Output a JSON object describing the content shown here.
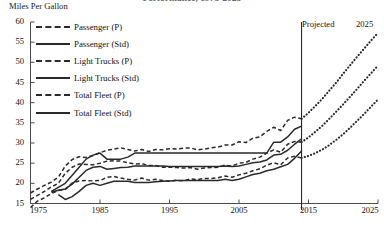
{
  "chart_data": {
    "type": "line",
    "title": "Performance, 1975-2025",
    "ylabel": "Miles Per Gallon",
    "xlabel": "",
    "xlim": [
      1975,
      2025
    ],
    "ylim": [
      15,
      60
    ],
    "y_ticks": [
      60,
      55,
      50,
      45,
      40,
      35,
      30,
      25,
      20,
      15
    ],
    "x_ticks": [
      1975,
      1985,
      1995,
      2005,
      2015,
      2025
    ],
    "grid": false,
    "legend_position": "upper-left",
    "projection_divider_year": 2014,
    "annotations": [
      {
        "text": "Projected",
        "x": 2015,
        "y": 58
      },
      {
        "text": "2025",
        "x": 2025,
        "y": 59
      }
    ],
    "series": [
      {
        "name": "Passenger (P)",
        "style": "dashed",
        "segment": "historical",
        "x": [
          1975,
          1976,
          1977,
          1978,
          1979,
          1980,
          1981,
          1982,
          1983,
          1984,
          1985,
          1986,
          1987,
          1988,
          1989,
          1990,
          1991,
          1992,
          1993,
          1994,
          1995,
          1996,
          1997,
          1998,
          1999,
          2000,
          2001,
          2002,
          2003,
          2004,
          2005,
          2006,
          2007,
          2008,
          2009,
          2010,
          2011,
          2012,
          2013,
          2014
        ],
        "values": [
          17.6,
          18.6,
          19.5,
          20.3,
          21.5,
          24.3,
          25.9,
          26.6,
          26.4,
          26.9,
          27.6,
          28.2,
          28.5,
          28.8,
          28.4,
          28.0,
          28.4,
          27.9,
          28.4,
          28.3,
          28.6,
          28.5,
          28.7,
          28.8,
          28.3,
          28.5,
          28.8,
          29.0,
          29.5,
          29.5,
          30.3,
          30.1,
          31.2,
          31.5,
          32.9,
          33.9,
          33.1,
          35.6,
          36.4,
          36.0
        ]
      },
      {
        "name": "Passenger (Std)",
        "style": "solid",
        "segment": "historical",
        "x": [
          1978,
          1979,
          1980,
          1981,
          1982,
          1983,
          1984,
          1985,
          1986,
          1987,
          1988,
          1989,
          1990,
          1991,
          1992,
          1993,
          1994,
          1995,
          1996,
          1997,
          1998,
          1999,
          2000,
          2001,
          2002,
          2003,
          2004,
          2005,
          2006,
          2007,
          2008,
          2009,
          2010,
          2011,
          2012,
          2013,
          2014
        ],
        "values": [
          18.0,
          19.0,
          20.0,
          22.0,
          24.0,
          26.0,
          27.0,
          27.5,
          26.0,
          26.0,
          26.0,
          26.5,
          27.5,
          27.5,
          27.5,
          27.5,
          27.5,
          27.5,
          27.5,
          27.5,
          27.5,
          27.5,
          27.5,
          27.5,
          27.5,
          27.5,
          27.5,
          27.5,
          27.5,
          27.5,
          27.5,
          27.5,
          30.2,
          30.2,
          31.5,
          33.4,
          34.2
        ]
      },
      {
        "name": "Light Trucks (P)",
        "style": "dashed",
        "segment": "historical",
        "x": [
          1975,
          1976,
          1977,
          1978,
          1979,
          1980,
          1981,
          1982,
          1983,
          1984,
          1985,
          1986,
          1987,
          1988,
          1989,
          1990,
          1991,
          1992,
          1993,
          1994,
          1995,
          1996,
          1997,
          1998,
          1999,
          2000,
          2001,
          2002,
          2003,
          2004,
          2005,
          2006,
          2007,
          2008,
          2009,
          2010,
          2011,
          2012,
          2013,
          2014
        ],
        "values": [
          14.0,
          15.6,
          16.4,
          17.5,
          18.2,
          18.5,
          20.1,
          20.6,
          20.7,
          20.6,
          20.7,
          21.5,
          21.7,
          21.3,
          21.0,
          20.8,
          21.3,
          20.8,
          21.0,
          20.7,
          20.5,
          20.8,
          20.6,
          21.1,
          20.9,
          21.2,
          21.2,
          21.4,
          21.8,
          21.5,
          22.1,
          22.5,
          23.1,
          23.6,
          24.5,
          25.1,
          24.6,
          26.3,
          26.7,
          26.3
        ]
      },
      {
        "name": "Light Trucks (Std)",
        "style": "solid",
        "segment": "historical",
        "x": [
          1979,
          1980,
          1981,
          1982,
          1983,
          1984,
          1985,
          1986,
          1987,
          1988,
          1989,
          1990,
          1991,
          1992,
          1993,
          1994,
          1995,
          1996,
          1997,
          1998,
          1999,
          2000,
          2001,
          2002,
          2003,
          2004,
          2005,
          2006,
          2007,
          2008,
          2009,
          2010,
          2011,
          2012,
          2013,
          2014
        ],
        "values": [
          17.2,
          16.0,
          16.7,
          18.0,
          19.5,
          20.0,
          19.5,
          20.0,
          20.5,
          20.5,
          20.5,
          20.2,
          20.2,
          20.2,
          20.4,
          20.5,
          20.6,
          20.7,
          20.7,
          20.7,
          20.7,
          20.7,
          20.7,
          20.7,
          21.0,
          20.7,
          21.0,
          21.6,
          22.2,
          22.5,
          23.1,
          23.5,
          24.1,
          24.7,
          26.2,
          28.0
        ]
      },
      {
        "name": "Total Fleet (P)",
        "style": "dashed",
        "segment": "historical",
        "x": [
          1975,
          1976,
          1977,
          1978,
          1979,
          1980,
          1981,
          1982,
          1983,
          1984,
          1985,
          1986,
          1987,
          1988,
          1989,
          1990,
          1991,
          1992,
          1993,
          1994,
          1995,
          1996,
          1997,
          1998,
          1999,
          2000,
          2001,
          2002,
          2003,
          2004,
          2005,
          2006,
          2007,
          2008,
          2009,
          2010,
          2011,
          2012,
          2013,
          2014
        ],
        "values": [
          16.0,
          17.0,
          18.0,
          19.1,
          20.0,
          22.5,
          24.0,
          24.8,
          24.7,
          24.6,
          25.0,
          25.5,
          25.6,
          25.5,
          25.1,
          24.8,
          24.9,
          24.4,
          24.4,
          24.0,
          24.0,
          23.9,
          23.8,
          23.9,
          23.5,
          23.8,
          23.9,
          24.0,
          24.5,
          24.3,
          25.0,
          25.2,
          26.0,
          26.5,
          27.5,
          28.3,
          27.7,
          29.7,
          30.4,
          30.2
        ]
      },
      {
        "name": "Total Fleet (Std)",
        "style": "solid",
        "segment": "historical",
        "x": [
          1978,
          1979,
          1980,
          1981,
          1982,
          1983,
          1984,
          1985,
          1986,
          1987,
          1988,
          1989,
          1990,
          1991,
          1992,
          1993,
          1994,
          1995,
          1996,
          1997,
          1998,
          1999,
          2000,
          2001,
          2002,
          2003,
          2004,
          2005,
          2006,
          2007,
          2008,
          2009,
          2010,
          2011,
          2012,
          2013,
          2014
        ],
        "values": [
          17.8,
          18.3,
          18.6,
          19.8,
          21.5,
          23.2,
          24.0,
          24.2,
          23.5,
          23.7,
          23.9,
          24.0,
          24.3,
          24.3,
          24.3,
          24.3,
          24.3,
          24.2,
          24.2,
          24.2,
          24.2,
          24.2,
          24.2,
          24.2,
          24.2,
          24.3,
          24.2,
          24.3,
          24.7,
          25.1,
          25.3,
          25.8,
          27.0,
          27.2,
          28.2,
          29.7,
          31.0
        ]
      },
      {
        "name": "Passenger (P) Projected",
        "style": "dotted",
        "segment": "projected",
        "x": [
          2014,
          2015,
          2016,
          2017,
          2018,
          2019,
          2020,
          2021,
          2022,
          2023,
          2024,
          2025
        ],
        "values": [
          36.0,
          37.5,
          39.2,
          41.0,
          43.0,
          45.0,
          47.2,
          49.3,
          51.4,
          53.4,
          55.4,
          57.3
        ]
      },
      {
        "name": "Total Fleet (P) Projected",
        "style": "dotted",
        "segment": "projected",
        "x": [
          2014,
          2015,
          2016,
          2017,
          2018,
          2019,
          2020,
          2021,
          2022,
          2023,
          2024,
          2025
        ],
        "values": [
          30.2,
          31.4,
          32.8,
          34.3,
          36.0,
          37.8,
          39.6,
          41.5,
          43.4,
          45.4,
          47.3,
          49.2
        ]
      },
      {
        "name": "Light Trucks (P) Projected",
        "style": "dotted",
        "segment": "projected",
        "x": [
          2014,
          2015,
          2016,
          2017,
          2018,
          2019,
          2020,
          2021,
          2022,
          2023,
          2024,
          2025
        ],
        "values": [
          26.3,
          26.8,
          27.5,
          28.4,
          29.5,
          30.8,
          32.2,
          33.8,
          35.5,
          37.2,
          39.0,
          40.8
        ]
      }
    ]
  },
  "legend": {
    "items": [
      {
        "label": "Passenger (P)",
        "style": "dashed"
      },
      {
        "label": "Passenger (Std)",
        "style": "solid"
      },
      {
        "label": "Light Trucks (P)",
        "style": "dashed"
      },
      {
        "label": "Light Trucks (Std)",
        "style": "solid"
      },
      {
        "label": "Total Fleet (P)",
        "style": "dashed"
      },
      {
        "label": "Total Fleet (Std)",
        "style": "solid"
      }
    ]
  },
  "colors": {
    "line": "#2a2a2a",
    "axis": "#4d4d4d",
    "text": "#111111"
  }
}
